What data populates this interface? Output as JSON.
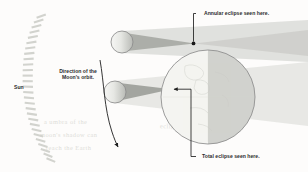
{
  "diagram": {
    "background_color": "#fdfcfb",
    "width": 308,
    "height": 172
  },
  "labels": {
    "sun": "Sun",
    "orbit_direction": "Direction of the Moon's orbit.",
    "annular": "Annular eclipse seen here.",
    "total": "Total eclipse seen here."
  },
  "ghost_text": {
    "line1": "a umbra of the",
    "line2": "moon's shadow can",
    "line3": "reach the Earth",
    "line4": "eclipse of the Sun"
  },
  "colors": {
    "background": "#fdfcfb",
    "ink": "#2b2b2b",
    "outline": "#8f8f8f",
    "penumbra": "#d9dad6",
    "umbra": "#a9aba6",
    "earth_day": "#f2f2ef",
    "earth_night": "#cfd0cb",
    "moon_fill": "#eeefec",
    "moon_shade": "#c3c5c0",
    "sun_ray": "#d5d6d1",
    "ghost": "#dededa"
  },
  "bodies": {
    "sun": {
      "name": "Sun",
      "representation": "arc-of-rays",
      "ray_count": 28,
      "arc_center_x": -120,
      "arc_center_y": 88,
      "arc_radius": 160
    },
    "moon_upper": {
      "name": "Moon (annular position)",
      "cx": 122,
      "cy": 42,
      "r": 11,
      "eclipse_type": "annular",
      "umbra_reaches_earth": false
    },
    "moon_lower": {
      "name": "Moon (total position)",
      "cx": 115,
      "cy": 92,
      "r": 11,
      "eclipse_type": "total",
      "umbra_reaches_earth": true
    },
    "earth": {
      "name": "Earth",
      "cx": 208,
      "cy": 97,
      "r": 47,
      "terminator_x": 208
    }
  },
  "annotations": {
    "annular_point": {
      "x": 193,
      "y": 44
    },
    "total_point": {
      "x": 171,
      "y": 89
    },
    "orbit_arrow_start": {
      "x": 100,
      "y": 62
    },
    "orbit_arrow_end": {
      "x": 118,
      "y": 148
    }
  }
}
